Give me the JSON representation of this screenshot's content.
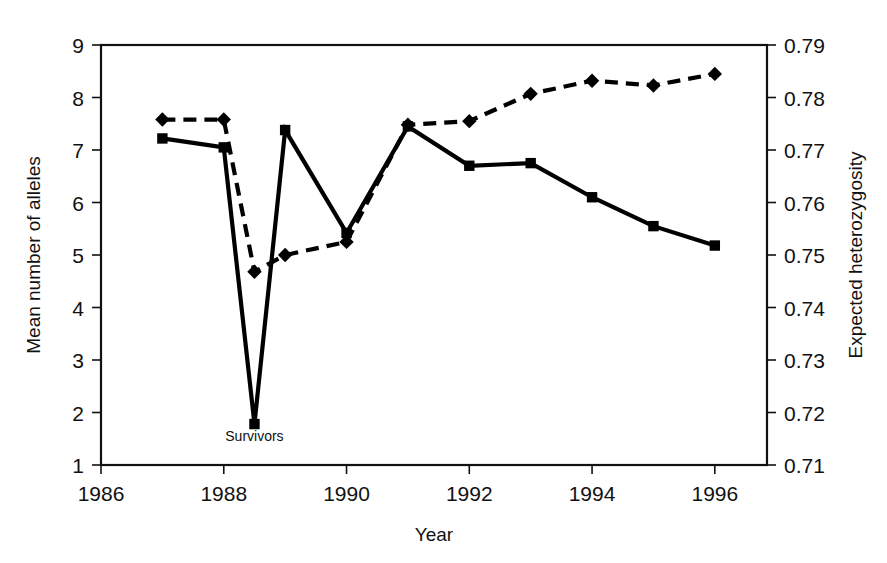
{
  "chart_data": {
    "type": "line",
    "title": "",
    "xlabel": "Year",
    "ylabel": "Mean number of alleles",
    "y2label": "Expected heterozygosity",
    "xlim": [
      1986,
      1996.85
    ],
    "ylim": [
      1,
      9
    ],
    "y2lim": [
      0.71,
      0.79
    ],
    "grid": false,
    "legend": "none",
    "x_ticks": [
      "1986",
      "1988",
      "1990",
      "1992",
      "1994",
      "1996"
    ],
    "x_tick_values": [
      1986,
      1988,
      1990,
      1992,
      1994,
      1996
    ],
    "y_ticks": [
      "1",
      "2",
      "3",
      "4",
      "5",
      "6",
      "7",
      "8",
      "9"
    ],
    "y_tick_values": [
      1,
      2,
      3,
      4,
      5,
      6,
      7,
      8,
      9
    ],
    "y2_ticks": [
      "0.71",
      "0.72",
      "0.73",
      "0.74",
      "0.75",
      "0.76",
      "0.77",
      "0.78",
      "0.79"
    ],
    "y2_tick_values": [
      0.71,
      0.72,
      0.73,
      0.74,
      0.75,
      0.76,
      0.77,
      0.78,
      0.79
    ],
    "annotations": [
      {
        "text": "Survivors",
        "x": 1988.5,
        "y": 1.45
      }
    ],
    "series": [
      {
        "name": "Mean number of alleles",
        "axis": "left",
        "marker": "square",
        "linestyle": "solid",
        "color": "#000000",
        "x": [
          1987,
          1988,
          1988.5,
          1989,
          1990,
          1991,
          1992,
          1993,
          1994,
          1995,
          1996
        ],
        "x_labels": [
          "1987",
          "1988",
          "Survivors",
          "1989",
          "1990",
          "1991",
          "1992",
          "1993",
          "1994",
          "1995",
          "1996"
        ],
        "values": [
          7.22,
          7.05,
          1.78,
          7.38,
          5.42,
          7.45,
          6.7,
          6.75,
          6.1,
          5.55,
          5.18
        ]
      },
      {
        "name": "Expected heterozygosity",
        "axis": "right",
        "marker": "diamond",
        "linestyle": "dashed",
        "color": "#000000",
        "x": [
          1987,
          1988,
          1988.5,
          1989,
          1990,
          1991,
          1992,
          1993,
          1994,
          1995,
          1996
        ],
        "x_labels": [
          "1987",
          "1988",
          "Survivors",
          "1989",
          "1990",
          "1991",
          "1992",
          "1993",
          "1994",
          "1995",
          "1996"
        ],
        "values": [
          0.7758,
          0.7758,
          0.7468,
          0.75,
          0.7525,
          0.7748,
          0.7755,
          0.7807,
          0.7832,
          0.7823,
          0.7845
        ]
      }
    ]
  }
}
